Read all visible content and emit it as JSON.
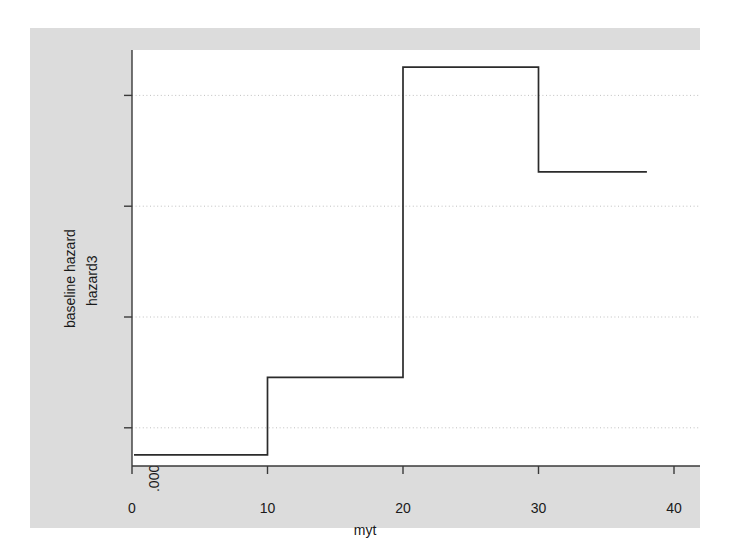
{
  "chart_data": {
    "type": "line",
    "step": "post",
    "title": "",
    "xlabel": "myt",
    "ylabel_outer": "baseline hazard",
    "ylabel_inner": "hazard3",
    "xlim": [
      0,
      40
    ],
    "ylim": [
      6.55e-05,
      0.000441
    ],
    "xticks": [
      0,
      10,
      20,
      30,
      40
    ],
    "xticklabels": [
      "0",
      "10",
      "20",
      "30",
      "40"
    ],
    "yticks": [
      0.0001,
      0.0002,
      0.0003,
      0.0004
    ],
    "yticklabels": [
      ".0001",
      ".0002",
      ".0003",
      ".0004"
    ],
    "grid": "horizontal-dotted",
    "legend": "none",
    "line_color": "#2b2b2b",
    "line_width": 1.6,
    "plot_bgcolor": "#ffffff",
    "graph_bgcolor": "#dcdcdc",
    "series": [
      {
        "name": "hazard3",
        "x": [
          0,
          10,
          20,
          30,
          38
        ],
        "values": [
          7.55e-05,
          0.0001455,
          0.0004255,
          0.000331,
          0.000331
        ]
      }
    ],
    "steps": [
      {
        "x_start": 0,
        "x_end": 10,
        "y": 7.55e-05
      },
      {
        "x_start": 10,
        "x_end": 20,
        "y": 0.0001455
      },
      {
        "x_start": 20,
        "x_end": 30,
        "y": 0.0004255
      },
      {
        "x_start": 30,
        "x_end": 38,
        "y": 0.000331
      }
    ]
  }
}
